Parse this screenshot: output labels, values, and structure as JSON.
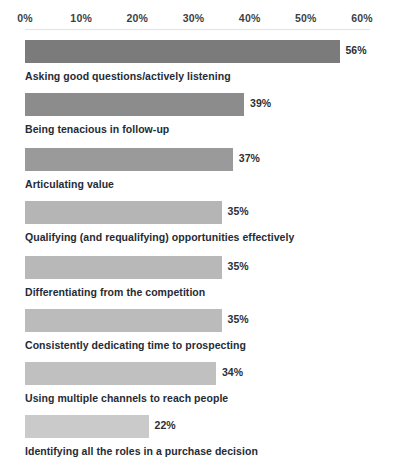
{
  "chart_data": {
    "type": "bar",
    "orientation": "horizontal",
    "title": "",
    "subtitle": "",
    "xlabel": "",
    "ylabel": "",
    "xlim": [
      0,
      60
    ],
    "grid": false,
    "legend": null,
    "value_suffix": "%",
    "axis_ticks": [
      "0%",
      "10%",
      "20%",
      "30%",
      "40%",
      "50%",
      "60%"
    ],
    "axis_tick_values": [
      0,
      10,
      20,
      30,
      40,
      50,
      60
    ],
    "categories": [
      "Asking good questions/actively listening",
      "Being tenacious in follow-up",
      "Articulating value",
      "Qualifying (and requalifying) opportunities effectively",
      "Differentiating from the competition",
      "Consistently dedicating time to prospecting",
      "Using multiple channels to reach people",
      "Identifying all the roles in a purchase decision"
    ],
    "values": [
      56,
      39,
      37,
      35,
      35,
      35,
      34,
      22
    ],
    "value_labels": [
      "56%",
      "39%",
      "37%",
      "35%",
      "35%",
      "35%",
      "34%",
      "22%"
    ],
    "bar_colors": [
      "#7b7b7b",
      "#8c8c8c",
      "#9a9a9a",
      "#b5b5b5",
      "#b8b8b8",
      "#bbbbbb",
      "#c0c0c0",
      "#cacaca"
    ],
    "background_color": "#ffffff",
    "text_color": "#262b35"
  }
}
